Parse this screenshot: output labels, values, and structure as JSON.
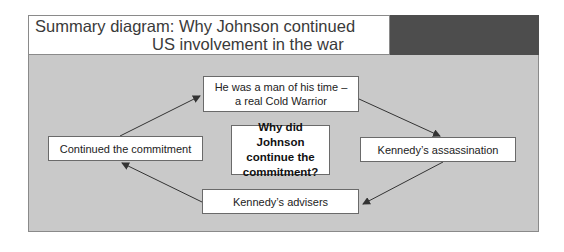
{
  "diagram": {
    "title_line1": "Summary diagram: Why Johnson continued",
    "title_line2": "US involvement in the war",
    "center_question": "Why did Johnson continue the commitment?",
    "nodes": [
      {
        "id": "cold-warrior",
        "label": "He was a man of his time – a real Cold Warrior"
      },
      {
        "id": "assassination",
        "label": "Kennedy’s assassination"
      },
      {
        "id": "advisers",
        "label": "Kennedy’s advisers"
      },
      {
        "id": "continued",
        "label": "Continued the commitment"
      }
    ],
    "edges": [
      {
        "from": "continued",
        "to": "cold-warrior"
      },
      {
        "from": "cold-warrior",
        "to": "assassination"
      },
      {
        "from": "assassination",
        "to": "advisers"
      },
      {
        "from": "advisers",
        "to": "continued"
      }
    ],
    "colors": {
      "panel": "#c9c9c9",
      "header_dark": "#4d4d4d",
      "box": "#ffffff",
      "arrow": "#333333"
    }
  }
}
